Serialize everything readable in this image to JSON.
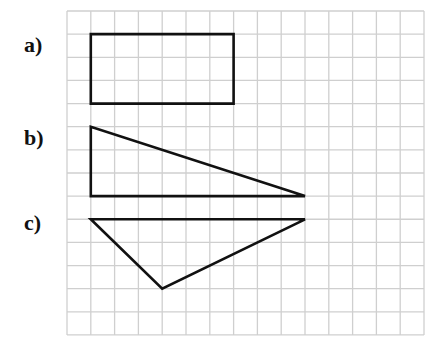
{
  "labels": {
    "a": "a)",
    "b": "b)",
    "c": "c)"
  },
  "grid": {
    "origin_x": 67,
    "origin_y": 11,
    "cols": 15,
    "rows": 14,
    "cell_w": 23.8,
    "cell_h": 23.14,
    "line_color": "#cfcfcf",
    "shape_color": "#111111"
  },
  "shapes": [
    {
      "id": "a",
      "type": "rectangle",
      "points_grid": [
        [
          1,
          1
        ],
        [
          7,
          1
        ],
        [
          7,
          4
        ],
        [
          1,
          4
        ]
      ]
    },
    {
      "id": "b",
      "type": "right-triangle",
      "points_grid": [
        [
          1,
          5
        ],
        [
          1,
          8
        ],
        [
          10,
          8
        ]
      ]
    },
    {
      "id": "c",
      "type": "triangle",
      "points_grid": [
        [
          1,
          9
        ],
        [
          10,
          9
        ],
        [
          4,
          12
        ]
      ]
    }
  ]
}
